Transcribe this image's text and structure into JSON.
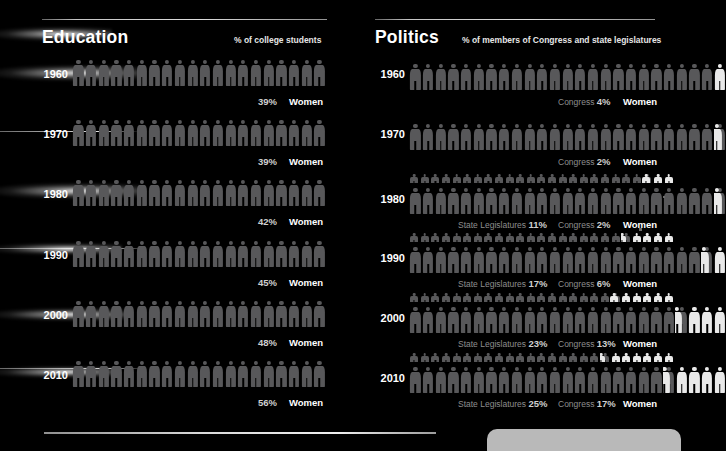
{
  "sections": {
    "education": {
      "title": "Education",
      "subtitle": "% of college students",
      "legend_label": "Women"
    },
    "politics": {
      "title": "Politics",
      "subtitle": "% of members of Congress and state legislatures",
      "legend_label": "Women",
      "congress_prefix": "Congress",
      "state_prefix": "State Legislatures"
    }
  },
  "labels": {
    "y1960": "1960",
    "y1970": "1970",
    "y1980": "1980",
    "y1990": "1990",
    "y2000": "2000",
    "y2010": "2010",
    "edu_1960_pct": "39%",
    "edu_1970_pct": "39%",
    "edu_1980_pct": "42%",
    "edu_1990_pct": "45%",
    "edu_2000_pct": "48%",
    "edu_2010_pct": "56%",
    "pol_1960_congress": "4%",
    "pol_1970_congress": "2%",
    "pol_1980_congress": "2%",
    "pol_1990_congress": "6%",
    "pol_2000_congress": "13%",
    "pol_2010_congress": "17%",
    "pol_1980_state": "11%",
    "pol_1990_state": "17%",
    "pol_2000_state": "23%",
    "pol_2010_state": "25%"
  },
  "colors": {
    "background": "#000000",
    "figure_grey": "#58585a",
    "figure_highlight": "#e9e9e9",
    "text_primary": "#ffffff",
    "text_muted": "#8e8e8e",
    "value_text": "#cfcfcf",
    "rule": "#d9d9d9",
    "bottom_tab": "#b9b9b9"
  },
  "chart_data": {
    "type": "pictogram",
    "icons_per_row": 20,
    "icon_unit_percent": 5,
    "charts": [
      {
        "name": "Education",
        "subtitle": "% of college students",
        "ylabel": "Year",
        "xlabel": "% of college students who are women",
        "categories": [
          "1960",
          "1970",
          "1980",
          "1990",
          "2000",
          "2010"
        ],
        "series": [
          {
            "name": "Women (% of college students)",
            "values": [
              39,
              39,
              42,
              45,
              48,
              56
            ],
            "icons_total": 20,
            "icons_highlighted": [
              0,
              0,
              0,
              0,
              0,
              0
            ],
            "note": "figures rendered uniformly grey in this panel"
          }
        ]
      },
      {
        "name": "Politics",
        "subtitle": "% of members of Congress and state legislatures",
        "ylabel": "Year",
        "xlabel": "% of legislators who are women",
        "categories": [
          "1960",
          "1970",
          "1980",
          "1990",
          "2000",
          "2010"
        ],
        "series": [
          {
            "name": "Congress",
            "values": [
              4,
              2,
              2,
              6,
              13,
              17
            ],
            "icons_total": 25,
            "icons_highlighted": [
              1.0,
              0.5,
              0.5,
              1.5,
              3.25,
              4.25
            ]
          },
          {
            "name": "State Legislatures",
            "values": [
              null,
              null,
              11,
              17,
              23,
              25
            ],
            "icons_total": 25,
            "icons_highlighted": [
              0,
              0,
              2.75,
              4.25,
              5.75,
              6.25
            ]
          }
        ],
        "legend": [
          "Congress",
          "State Legislatures",
          "Women"
        ]
      }
    ],
    "grid": false,
    "legend_position": "inline-right"
  }
}
